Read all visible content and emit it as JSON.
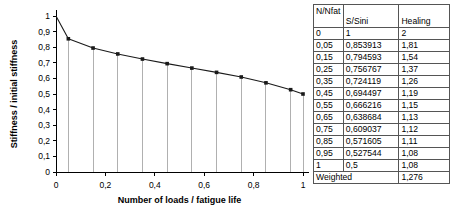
{
  "chart_data": {
    "type": "line",
    "title": "",
    "xlabel": "Number of loads / fatigue life",
    "ylabel": "Stiffness / initial stiffness",
    "xlim": [
      0,
      1
    ],
    "ylim": [
      0,
      1
    ],
    "xticks": [
      "0",
      "0,2",
      "0,4",
      "0,6",
      "0,8",
      "1"
    ],
    "xtick_values": [
      0,
      0.2,
      0.4,
      0.6,
      0.8,
      1
    ],
    "yticks": [
      "0",
      "0,1",
      "0,2",
      "0,3",
      "0,4",
      "0,5",
      "0,6",
      "0,7",
      "0,8",
      "0,9",
      "1"
    ],
    "ytick_values": [
      0,
      0.1,
      0.2,
      0.3,
      0.4,
      0.5,
      0.6,
      0.7,
      0.8,
      0.9,
      1
    ],
    "grid": false,
    "legend": "none",
    "markers": true,
    "drop_lines": true,
    "series": [
      {
        "name": "S/Sini",
        "x": [
          0,
          0.05,
          0.15,
          0.25,
          0.35,
          0.45,
          0.55,
          0.65,
          0.75,
          0.85,
          0.95,
          1
        ],
        "values": [
          1,
          0.853913,
          0.794593,
          0.756767,
          0.724119,
          0.694497,
          0.666216,
          0.638684,
          0.609037,
          0.571605,
          0.527544,
          0.5
        ]
      }
    ]
  },
  "table": {
    "name": "healing-data-table",
    "headers": {
      "col_a": "N/Nfat",
      "col_b": "S/Sini",
      "col_c": "Healing"
    },
    "rows": [
      {
        "a": "0",
        "b": "1",
        "c": "2"
      },
      {
        "a": "0,05",
        "b": "0,853913",
        "c": "1,81"
      },
      {
        "a": "0,15",
        "b": "0,794593",
        "c": "1,54"
      },
      {
        "a": "0,25",
        "b": "0,756767",
        "c": "1,37"
      },
      {
        "a": "0,35",
        "b": "0,724119",
        "c": "1,26"
      },
      {
        "a": "0,45",
        "b": "0,694497",
        "c": "1,19"
      },
      {
        "a": "0,55",
        "b": "0,666216",
        "c": "1,15"
      },
      {
        "a": "0,65",
        "b": "0,638684",
        "c": "1,13"
      },
      {
        "a": "0,75",
        "b": "0,609037",
        "c": "1,12"
      },
      {
        "a": "0,85",
        "b": "0,571605",
        "c": "1,11"
      },
      {
        "a": "0,95",
        "b": "0,527544",
        "c": "1,08"
      },
      {
        "a": "1",
        "b": "0,5",
        "c": "1,08"
      }
    ],
    "footer": {
      "label": "Weighted",
      "value": "1,276"
    }
  },
  "colors": {
    "series_line": "#1a1a1a",
    "drop_line": "#b0b0b0",
    "axis": "#000000",
    "table_border": "#555555",
    "background": "#ffffff"
  }
}
